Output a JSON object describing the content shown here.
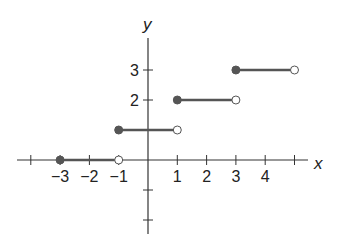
{
  "chart_data": {
    "type": "line",
    "subtype": "step-function",
    "title": "",
    "xlabel": "x",
    "ylabel": "y",
    "xlim": [
      -4.5,
      5.5
    ],
    "ylim": [
      -2.5,
      4
    ],
    "grid": false,
    "legend": null,
    "x_ticks": [
      -4,
      -3,
      -2,
      -1,
      1,
      2,
      3,
      4,
      5
    ],
    "x_tick_labels": [
      "-3",
      "-2",
      "-1",
      "1",
      "2",
      "3",
      "4"
    ],
    "x_tick_label_values": [
      -3,
      -2,
      -1,
      1,
      2,
      3,
      4
    ],
    "y_ticks": [
      -2,
      -1,
      1,
      2,
      3
    ],
    "y_tick_labels": [
      "2",
      "3"
    ],
    "y_tick_label_values": [
      2,
      3
    ],
    "series": [
      {
        "name": "segment-1",
        "x_start": -3,
        "x_end": -1,
        "y": 0,
        "start_closed": true,
        "end_closed": false
      },
      {
        "name": "segment-2",
        "x_start": -1,
        "x_end": 1,
        "y": 1,
        "start_closed": true,
        "end_closed": false
      },
      {
        "name": "segment-3",
        "x_start": 1,
        "x_end": 3,
        "y": 2,
        "start_closed": true,
        "end_closed": false
      },
      {
        "name": "segment-4",
        "x_start": 3,
        "x_end": 5,
        "y": 3,
        "start_closed": true,
        "end_closed": false
      }
    ],
    "colors": {
      "axis": "#333333",
      "segment": "#555555",
      "closed_dot": "#555555",
      "open_dot_fill": "#ffffff"
    }
  }
}
